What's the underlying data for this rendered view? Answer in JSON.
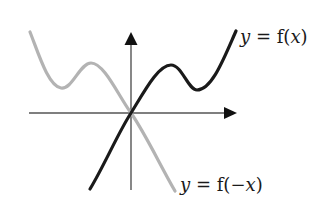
{
  "diagram": {
    "type": "function-reflection-graph",
    "colors": {
      "background": "#ffffff",
      "axes": "#555555",
      "arrowheads": "#111111",
      "curve_f": "#1a1a1a",
      "curve_reflected": "#b3b3b3",
      "label_text": "#1a1a1a"
    },
    "axes": {
      "origin": [
        131,
        113
      ],
      "x_axis": {
        "from": [
          29,
          113
        ],
        "to": [
          237,
          113
        ],
        "arrow": "right"
      },
      "y_axis": {
        "from": [
          131,
          190
        ],
        "to": [
          131,
          32
        ],
        "arrow": "up"
      }
    },
    "curves": [
      {
        "name": "f",
        "label": {
          "var": "y",
          "eq": " = ",
          "fn": "f(",
          "arg_sign": "",
          "arg": "x",
          "close": ")"
        },
        "stroke": "#1a1a1a",
        "start": [
          90,
          189
        ],
        "through_origin": [
          131,
          113
        ],
        "local_max": [
          171,
          65
        ],
        "local_min": [
          197,
          90
        ],
        "end": [
          236,
          31
        ]
      },
      {
        "name": "f-reflected",
        "label": {
          "var": "y",
          "eq": " = ",
          "fn": "f(",
          "arg_sign": "−",
          "arg": "x",
          "close": ")"
        },
        "stroke": "#b3b3b3",
        "start": [
          30,
          32
        ],
        "local_min": [
          61,
          88
        ],
        "local_max": [
          91,
          63
        ],
        "through_origin": [
          131,
          113
        ],
        "end": [
          175,
          191
        ]
      }
    ]
  }
}
